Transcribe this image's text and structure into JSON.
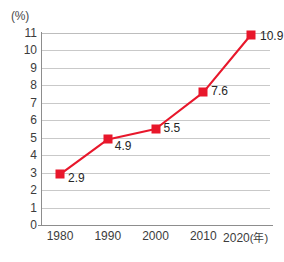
{
  "chart_data": {
    "type": "line",
    "title": "",
    "subtitle": "",
    "xlabel": "(年)",
    "ylabel": "(%)",
    "x": [
      1980,
      1990,
      2000,
      2010,
      2020
    ],
    "categories": [
      "1980",
      "1990",
      "2000",
      "2010",
      "2020"
    ],
    "values": [
      2.9,
      4.9,
      5.5,
      7.6,
      10.9
    ],
    "point_labels": [
      "2.9",
      "4.9",
      "5.5",
      "7.6",
      "10.9"
    ],
    "series": [
      {
        "name": "",
        "values": [
          2.9,
          4.9,
          5.5,
          7.6,
          10.9
        ],
        "color": "#e8172b",
        "marker": "square"
      }
    ],
    "ylim": [
      0,
      11
    ],
    "xlim": [
      1975,
      2025
    ],
    "ytick_labels": [
      "11",
      "10",
      "9",
      "8",
      "7",
      "6",
      "5",
      "4",
      "3",
      "2",
      "1",
      "0"
    ],
    "ytick_values": [
      11,
      10,
      9,
      8,
      7,
      6,
      5,
      4,
      3,
      2,
      1,
      0
    ],
    "xtick_labels": [
      "1980",
      "1990",
      "2000",
      "2010",
      "2020"
    ],
    "xaxis_unit": "(年)",
    "yaxis_unit": "(%)",
    "grid": "horizontal",
    "legend": "none",
    "gridline_color": "#c9c9c9",
    "axis_color": "#8d8d8d",
    "accent_color": "#e8172b",
    "text_color": "#3c3c3c"
  }
}
